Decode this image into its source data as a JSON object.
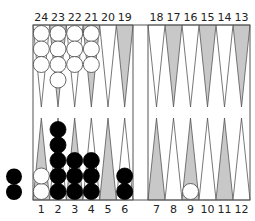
{
  "game": "Backgammon",
  "colors": {
    "board_bg": "#ffffff",
    "line": "#555555",
    "shaded_point": "#c8c8c8",
    "light_point": "#ffffff",
    "white_checker": "#ffffff",
    "black_checker": "#000000",
    "label": "#222222"
  },
  "labels": {
    "top": [
      "24",
      "23",
      "22",
      "21",
      "20",
      "19",
      "18",
      "17",
      "16",
      "15",
      "14",
      "13"
    ],
    "bottom": [
      "1",
      "2",
      "3",
      "4",
      "5",
      "6",
      "7",
      "8",
      "9",
      "10",
      "11",
      "12"
    ]
  },
  "points": [
    {
      "point": 1,
      "color": "white",
      "count": 2
    },
    {
      "point": 2,
      "color": "black",
      "count": 5
    },
    {
      "point": 3,
      "color": "black",
      "count": 3
    },
    {
      "point": 4,
      "color": "black",
      "count": 3
    },
    {
      "point": 5,
      "color": null,
      "count": 0
    },
    {
      "point": 6,
      "color": "black",
      "count": 2
    },
    {
      "point": 7,
      "color": null,
      "count": 0
    },
    {
      "point": 8,
      "color": null,
      "count": 0
    },
    {
      "point": 9,
      "color": "white",
      "count": 1
    },
    {
      "point": 10,
      "color": null,
      "count": 0
    },
    {
      "point": 11,
      "color": null,
      "count": 0
    },
    {
      "point": 12,
      "color": null,
      "count": 0
    },
    {
      "point": 13,
      "color": null,
      "count": 0
    },
    {
      "point": 14,
      "color": null,
      "count": 0
    },
    {
      "point": 15,
      "color": null,
      "count": 0
    },
    {
      "point": 16,
      "color": null,
      "count": 0
    },
    {
      "point": 17,
      "color": null,
      "count": 0
    },
    {
      "point": 18,
      "color": null,
      "count": 0
    },
    {
      "point": 19,
      "color": null,
      "count": 0
    },
    {
      "point": 20,
      "color": null,
      "count": 0
    },
    {
      "point": 21,
      "color": "white",
      "count": 3
    },
    {
      "point": 22,
      "color": "white",
      "count": 3
    },
    {
      "point": 23,
      "color": "white",
      "count": 4
    },
    {
      "point": 24,
      "color": "white",
      "count": 3
    }
  ],
  "borne_off": {
    "black": 2,
    "white": 0
  }
}
